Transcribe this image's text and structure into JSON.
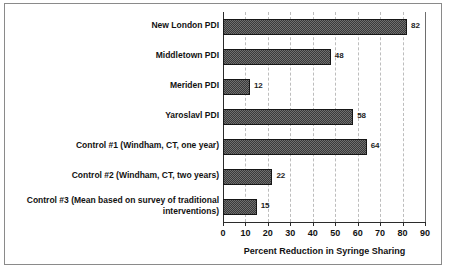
{
  "chart_data": {
    "type": "bar",
    "orientation": "horizontal",
    "title": "",
    "xlabel": "Percent Reduction in Syringe Sharing",
    "ylabel": "",
    "xlim": [
      0,
      90
    ],
    "xticks": [
      0,
      10,
      20,
      30,
      40,
      50,
      60,
      70,
      80,
      90
    ],
    "grid": true,
    "grid_axis": "x",
    "legend": false,
    "bar_color": "#6f6f6f",
    "bar_edge_color": "#161616",
    "bar_pattern": "checkered-dither",
    "categories": [
      "New London PDI",
      "Middletown PDI",
      "Meriden PDI",
      "Yaroslavl PDI",
      "Control #1 (Windham, CT, one year)",
      "Control #2 (Windham, CT, two years)",
      "Control #3 (Mean based on survey of traditional\ninterventions)"
    ],
    "values": [
      82,
      48,
      12,
      58,
      64,
      22,
      15
    ],
    "value_labels": [
      "82",
      "48",
      "12",
      "58",
      "64",
      "22",
      "15"
    ]
  }
}
